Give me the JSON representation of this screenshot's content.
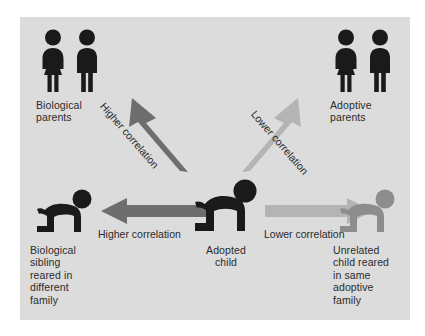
{
  "figure": {
    "background_color": "#ffffff",
    "panel_color": "#dcdcdc",
    "text_color": "#2b2b2b"
  },
  "colors": {
    "dark_figure": "#1a1a1a",
    "gray_figure": "#8d8d8d",
    "arrow_dark": "#6e6e6e",
    "arrow_light": "#b4b4b4"
  },
  "nodes": [
    {
      "id": "biological-parents",
      "label": "Biological\nparents",
      "icon": "two-adults-icon",
      "tone": "dark",
      "position": "top-left"
    },
    {
      "id": "adoptive-parents",
      "label": "Adoptive\nparents",
      "icon": "two-adults-icon",
      "tone": "dark",
      "position": "top-right"
    },
    {
      "id": "biological-sibling",
      "label": "Biological\nsibling\nreared in\ndifferent\nfamily",
      "icon": "crawling-child-icon",
      "tone": "dark",
      "position": "bottom-left"
    },
    {
      "id": "adopted-child",
      "label": "Adopted\nchild",
      "icon": "crawling-child-icon",
      "tone": "dark",
      "position": "bottom-center"
    },
    {
      "id": "unrelated-child",
      "label": "Unrelated\nchild reared\nin same\nadoptive\nfamily",
      "icon": "crawling-child-icon",
      "tone": "gray",
      "position": "bottom-right"
    }
  ],
  "arrows": [
    {
      "id": "arrow-to-biological-parents",
      "label": "Higher correlation",
      "from": "adopted-child",
      "to": "biological-parents",
      "strength": "higher",
      "color": "#6e6e6e",
      "direction": "up-left"
    },
    {
      "id": "arrow-to-adoptive-parents",
      "label": "Lower correlation",
      "from": "adopted-child",
      "to": "adoptive-parents",
      "strength": "lower",
      "color": "#b4b4b4",
      "direction": "up-right"
    },
    {
      "id": "arrow-to-biological-sibling",
      "label": "Higher correlation",
      "from": "adopted-child",
      "to": "biological-sibling",
      "strength": "higher",
      "color": "#6e6e6e",
      "direction": "left"
    },
    {
      "id": "arrow-to-unrelated-child",
      "label": "Lower correlation",
      "from": "adopted-child",
      "to": "unrelated-child",
      "strength": "lower",
      "color": "#b4b4b4",
      "direction": "right"
    }
  ]
}
